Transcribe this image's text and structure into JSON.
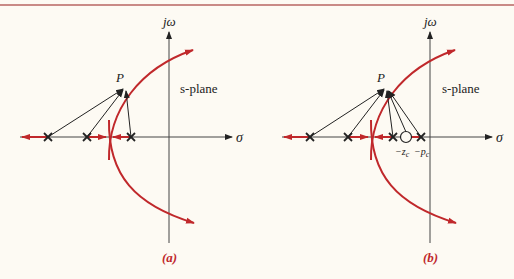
{
  "colors": {
    "root_locus": "#c0282b",
    "axes": "#333333",
    "background": "#fdfaf3",
    "top_rule": "#c98a86"
  },
  "panels": [
    {
      "id": "a",
      "caption": "(a)",
      "axis_labels": {
        "imag": "jω",
        "real": "σ"
      },
      "plane_label": "s-plane",
      "point_label": "P",
      "poles": 3,
      "zeros": 0,
      "vectors_to_P": 3
    },
    {
      "id": "b",
      "caption": "(b)",
      "axis_labels": {
        "imag": "jω",
        "real": "σ"
      },
      "plane_label": "s-plane",
      "point_label": "P",
      "poles": 4,
      "zeros": 1,
      "vectors_to_P": 5,
      "compensator_labels": {
        "zero": "−z",
        "zero_sub": "c",
        "pole": "−p",
        "pole_sub": "c"
      }
    }
  ]
}
